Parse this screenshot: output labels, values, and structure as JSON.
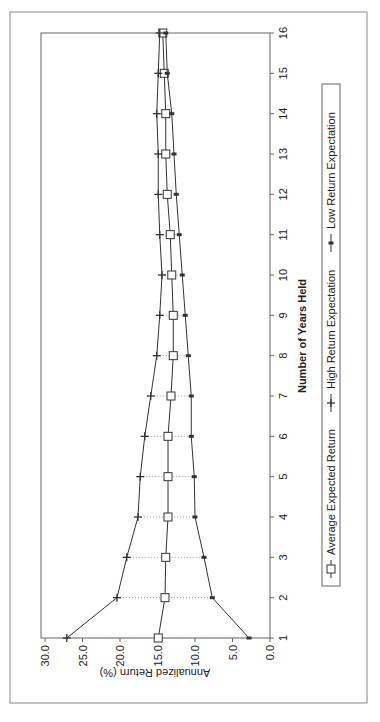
{
  "chart_data": {
    "type": "line",
    "title": "",
    "xlabel": "Number of Years Held",
    "ylabel": "Annualized Return (%)",
    "x": [
      1,
      2,
      3,
      4,
      5,
      6,
      7,
      8,
      9,
      10,
      11,
      12,
      13,
      14,
      15,
      16
    ],
    "ylim": [
      0,
      30
    ],
    "yticks": [
      "0.0",
      "5.0",
      "10.0",
      "15.0",
      "20.0",
      "25.0",
      "30.0"
    ],
    "xticks": [
      "1",
      "2",
      "3",
      "4",
      "5",
      "6",
      "7",
      "8",
      "9",
      "10",
      "11",
      "12",
      "13",
      "14",
      "15",
      "16"
    ],
    "grid": false,
    "high_low_lines": true,
    "legend_position": "bottom",
    "orientation_note": "figure rotated 90 degrees counter-clockwise on page",
    "series": [
      {
        "name": "Average Expected Return",
        "marker": "square",
        "values": [
          14.9,
          14.0,
          13.9,
          13.6,
          13.6,
          13.6,
          13.2,
          12.9,
          12.9,
          13.1,
          13.3,
          13.7,
          13.9,
          13.9,
          14.1,
          14.3
        ]
      },
      {
        "name": "High Return Expectation",
        "marker": "plus",
        "values": [
          27.1,
          20.4,
          19.1,
          17.6,
          17.3,
          16.7,
          15.9,
          15.1,
          14.7,
          14.4,
          14.7,
          14.9,
          14.9,
          15.1,
          14.9,
          14.7
        ]
      },
      {
        "name": "Low Return Expectation",
        "marker": "dash",
        "values": [
          2.8,
          7.7,
          8.8,
          10.0,
          10.1,
          10.5,
          10.5,
          10.9,
          11.3,
          11.7,
          12.1,
          12.5,
          12.8,
          13.1,
          13.7,
          13.9
        ]
      }
    ]
  },
  "colors": {
    "line": "#333333",
    "frame": "#888888",
    "dotted": "#999999",
    "background": "#ffffff"
  }
}
